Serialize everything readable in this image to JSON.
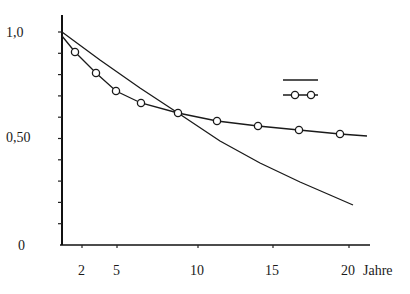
{
  "chart_data": {
    "type": "line",
    "title": "",
    "xlabel": "Jahre",
    "ylabel": "",
    "xlim": [
      0,
      21
    ],
    "ylim": [
      0,
      1.05
    ],
    "grid": false,
    "legend_position": "upper right (symbols only, no text)",
    "y_ticks": [
      {
        "value": 1.0,
        "label": "1,0"
      },
      {
        "value": 0.5,
        "label": "0,50"
      },
      {
        "value": 0,
        "label": "0"
      }
    ],
    "x_ticks": [
      {
        "value": 2,
        "label": "2"
      },
      {
        "value": 5,
        "label": "5"
      },
      {
        "value": 10,
        "label": "10"
      },
      {
        "value": 15,
        "label": "15"
      },
      {
        "value": 20,
        "label": "20"
      }
    ],
    "x_unit_label": "Jahre",
    "series": [
      {
        "name": "solid line",
        "style": "solid",
        "marker": "none",
        "x": [
          0,
          2.5,
          5,
          7.5,
          10,
          12.5,
          15,
          17.5,
          20
        ],
        "values": [
          1.0,
          0.9,
          0.81,
          0.72,
          0.62,
          0.52,
          0.42,
          0.31,
          0.19
        ]
      },
      {
        "name": "line with circles",
        "style": "solid",
        "marker": "circle",
        "x": [
          0,
          1.5,
          3,
          4.5,
          6.2,
          8.6,
          11.3,
          14,
          16.7,
          19.4,
          21
        ],
        "values": [
          0.98,
          0.91,
          0.81,
          0.72,
          0.67,
          0.62,
          0.58,
          0.56,
          0.54,
          0.52,
          0.51
        ],
        "marker_indices": [
          1,
          2,
          3,
          4,
          5,
          6,
          7,
          8,
          9
        ]
      }
    ]
  },
  "plot": {
    "px": {
      "axis_x": 62,
      "axis_top": 15,
      "axis_bottom": 245,
      "axis_right": 370,
      "y_at_1": 32,
      "y_at_0": 245,
      "x_ticks_px": [
        82,
        117,
        198,
        273,
        349
      ]
    },
    "solid_path_px": [
      [
        62,
        32
      ],
      [
        100,
        60
      ],
      [
        140,
        88
      ],
      [
        178,
        113
      ],
      [
        220,
        141
      ],
      [
        260,
        163
      ],
      [
        300,
        182
      ],
      [
        330,
        195
      ],
      [
        353,
        205
      ]
    ],
    "circle_path_px": [
      [
        62,
        36
      ],
      [
        75,
        52
      ],
      [
        96,
        73
      ],
      [
        116,
        91
      ],
      [
        141,
        103
      ],
      [
        178,
        113
      ],
      [
        217,
        121
      ],
      [
        258,
        126
      ],
      [
        299,
        130
      ],
      [
        340,
        134
      ],
      [
        367,
        136
      ]
    ],
    "circle_markers_px": [
      [
        75,
        52
      ],
      [
        96,
        73
      ],
      [
        116,
        91
      ],
      [
        141,
        103
      ],
      [
        178,
        113
      ],
      [
        217,
        121
      ],
      [
        258,
        126
      ],
      [
        299,
        130
      ],
      [
        340,
        134
      ]
    ],
    "legend": {
      "solid": {
        "x1": 283,
        "x2": 318,
        "y": 80
      },
      "circles": {
        "x1": 283,
        "x2": 318,
        "y": 95,
        "markers": [
          295,
          311
        ]
      }
    }
  },
  "labels": {
    "y_1": "1,0",
    "y_050": "0,50",
    "y_0": "0",
    "x_2": "2",
    "x_5": "5",
    "x_10": "10",
    "x_15": "15",
    "x_20": "20",
    "x_unit": "Jahre"
  }
}
